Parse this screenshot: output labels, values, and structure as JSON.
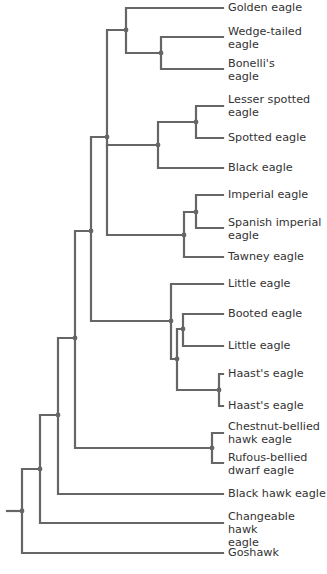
{
  "diagram": {
    "type": "phylogenetic-tree",
    "colors": {
      "branch": "#666666",
      "label": "#333333",
      "background": "#ffffff"
    },
    "leaves": [
      {
        "id": "golden",
        "label": "Golden eagle",
        "y": 8,
        "label_top": 1
      },
      {
        "id": "wedge",
        "label": "Wedge-tailed\neagle",
        "y": 37,
        "label_top": 25
      },
      {
        "id": "bonelli",
        "label": "Bonelli's\neagle",
        "y": 69,
        "label_top": 57
      },
      {
        "id": "lesser",
        "label": "Lesser spotted\neagle",
        "y": 106,
        "label_top": 93
      },
      {
        "id": "spotted",
        "label": "Spotted eagle",
        "y": 138,
        "label_top": 131
      },
      {
        "id": "black",
        "label": "Black eagle",
        "y": 168,
        "label_top": 161
      },
      {
        "id": "imperial",
        "label": "Imperial eagle",
        "y": 195,
        "label_top": 188
      },
      {
        "id": "spanish",
        "label": "Spanish imperial\neagle",
        "y": 228,
        "label_top": 216
      },
      {
        "id": "tawney",
        "label": "Tawney eagle",
        "y": 257,
        "label_top": 250
      },
      {
        "id": "little1",
        "label": "Little eagle",
        "y": 284,
        "label_top": 277
      },
      {
        "id": "booted",
        "label": "Booted eagle",
        "y": 314,
        "label_top": 307
      },
      {
        "id": "little2",
        "label": "Little eagle",
        "y": 346,
        "label_top": 339
      },
      {
        "id": "haast1",
        "label": "Haast's eagle",
        "y": 374,
        "label_top": 367
      },
      {
        "id": "haast2",
        "label": "Haast's eagle",
        "y": 406,
        "label_top": 399
      },
      {
        "id": "chestnut",
        "label": "Chestnut-bellied\nhawk eagle",
        "y": 433,
        "label_top": 420
      },
      {
        "id": "rufous",
        "label": "Rufous-bellied\ndwarf eagle",
        "y": 463,
        "label_top": 451
      },
      {
        "id": "blackhawk",
        "label": "Black hawk eagle",
        "y": 494,
        "label_top": 487
      },
      {
        "id": "changeable",
        "label": "Changeable hawk\neagle",
        "y": 523,
        "label_top": 510
      },
      {
        "id": "goshawk",
        "label": "Goshawk",
        "y": 553,
        "label_top": 546
      }
    ]
  }
}
